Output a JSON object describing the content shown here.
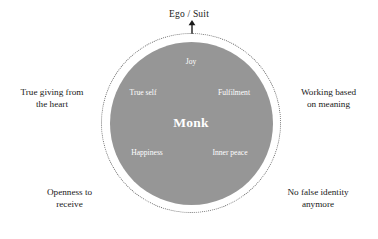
{
  "diagram": {
    "title_label": "Ego / Suit",
    "arrow_icon": "up-arrow-icon",
    "core": {
      "center_label": "Monk",
      "qualities": [
        {
          "id": "joy",
          "label": "Joy"
        },
        {
          "id": "true-self",
          "label": "True self"
        },
        {
          "id": "fulfilment",
          "label": "Fulfilment"
        },
        {
          "id": "happiness",
          "label": "Happiness"
        },
        {
          "id": "inner-peace",
          "label": "Inner peace"
        }
      ]
    },
    "outcomes": [
      {
        "id": "true-giving",
        "line1": "True giving from",
        "line2": "the heart"
      },
      {
        "id": "working-meaning",
        "line1": "Working based",
        "line2": "on meaning"
      },
      {
        "id": "openness",
        "line1": "Openness to",
        "line2": "receive"
      },
      {
        "id": "no-false-identity",
        "line1": "No false identity",
        "line2": "anymore"
      }
    ],
    "colors": {
      "disc_fill": "#969696",
      "ring_stroke": "#6f6f6f",
      "inner_text": "#ffffff",
      "outer_text": "#1a1a1a",
      "background": "#ffffff"
    }
  }
}
